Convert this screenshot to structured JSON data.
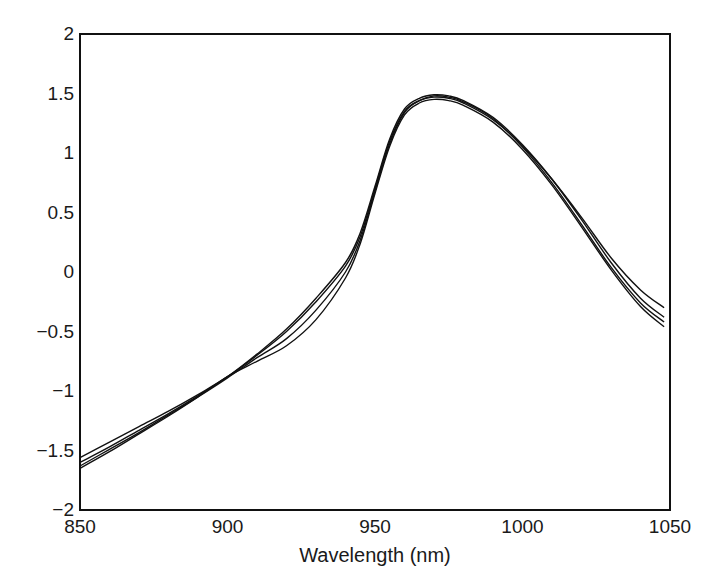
{
  "chart_data": {
    "type": "line",
    "title": "",
    "xlabel": "Wavelength (nm)",
    "ylabel": "",
    "xlim": [
      850,
      1050
    ],
    "ylim": [
      -2,
      2
    ],
    "grid": false,
    "legend": null,
    "x_ticks": [
      850,
      900,
      950,
      1000,
      1050
    ],
    "x_tick_labels": [
      "850",
      "900",
      "950",
      "1000",
      "1050"
    ],
    "y_ticks": [
      2,
      1.5,
      1,
      0.5,
      0,
      -0.5,
      -1,
      -1.5,
      -2
    ],
    "y_tick_labels": [
      "2",
      "1.5",
      "1",
      "0.5",
      "0",
      "−0.5",
      "−1",
      "−1.5",
      "−2"
    ],
    "x": [
      850,
      860,
      870,
      880,
      890,
      900,
      910,
      920,
      930,
      940,
      945,
      950,
      955,
      960,
      965,
      970,
      975,
      980,
      990,
      1000,
      1010,
      1020,
      1030,
      1040,
      1048
    ],
    "series": [
      {
        "name": "Spectrum 1",
        "values": [
          -1.56,
          -1.43,
          -1.3,
          -1.17,
          -1.03,
          -0.88,
          -0.7,
          -0.5,
          -0.25,
          0.05,
          0.3,
          0.7,
          1.1,
          1.35,
          1.44,
          1.47,
          1.46,
          1.42,
          1.28,
          1.06,
          0.78,
          0.46,
          0.12,
          -0.15,
          -0.3
        ]
      },
      {
        "name": "Spectrum 2",
        "values": [
          -1.6,
          -1.47,
          -1.33,
          -1.19,
          -1.04,
          -0.88,
          -0.69,
          -0.48,
          -0.22,
          0.08,
          0.33,
          0.72,
          1.12,
          1.37,
          1.46,
          1.49,
          1.48,
          1.44,
          1.3,
          1.07,
          0.78,
          0.44,
          0.08,
          -0.22,
          -0.38
        ]
      },
      {
        "name": "Spectrum 3",
        "values": [
          -1.63,
          -1.49,
          -1.35,
          -1.2,
          -1.05,
          -0.89,
          -0.72,
          -0.56,
          -0.32,
          0.0,
          0.27,
          0.68,
          1.08,
          1.34,
          1.44,
          1.48,
          1.47,
          1.43,
          1.29,
          1.05,
          0.75,
          0.4,
          0.04,
          -0.26,
          -0.42
        ]
      },
      {
        "name": "Spectrum 4",
        "values": [
          -1.65,
          -1.51,
          -1.36,
          -1.21,
          -1.05,
          -0.88,
          -0.75,
          -0.62,
          -0.4,
          -0.05,
          0.24,
          0.66,
          1.06,
          1.32,
          1.42,
          1.45,
          1.44,
          1.4,
          1.26,
          1.03,
          0.73,
          0.38,
          0.02,
          -0.29,
          -0.46
        ]
      }
    ]
  },
  "labels": {
    "xlabel": "Wavelength (nm)"
  },
  "colors": {
    "line": "#111111",
    "axis": "#111111",
    "text": "#1a1a1a"
  }
}
